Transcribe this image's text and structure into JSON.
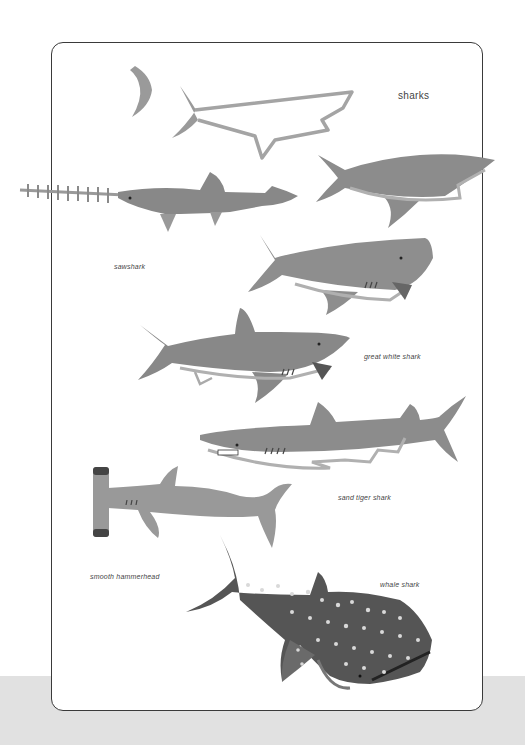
{
  "page": {
    "title": "sharks",
    "colors": {
      "background": "#ffffff",
      "band": "#e1e1e1",
      "border": "#3a3a3a",
      "shark_gray": "#8a8a8a",
      "shark_light": "#a8a8a8",
      "shark_dark": "#555555",
      "text": "#444444"
    }
  },
  "labels": [
    {
      "id": "sawshark",
      "text": "sawshark"
    },
    {
      "id": "great-white",
      "text": "great white shark"
    },
    {
      "id": "sand-tiger",
      "text": "sand tiger shark"
    },
    {
      "id": "hammerhead",
      "text": "smooth hammerhead"
    },
    {
      "id": "whale-shark",
      "text": "whale shark"
    }
  ]
}
